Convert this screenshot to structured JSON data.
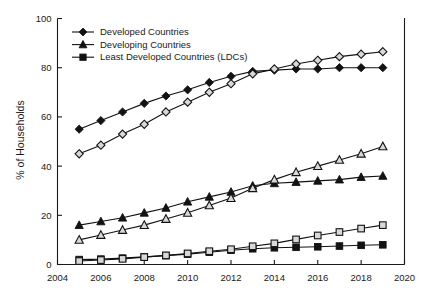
{
  "chart_data": {
    "type": "line",
    "title": "",
    "xlabel": "",
    "ylabel": "% of Households",
    "xlim": [
      2004,
      2020
    ],
    "ylim": [
      0,
      100
    ],
    "xticks": [
      2004,
      2006,
      2008,
      2010,
      2012,
      2014,
      2016,
      2018,
      2020
    ],
    "yticks": [
      0,
      20,
      40,
      60,
      80,
      100
    ],
    "grid": false,
    "legend_position": "top-left",
    "x": [
      2005,
      2006,
      2007,
      2008,
      2009,
      2010,
      2011,
      2012,
      2013,
      2014,
      2015,
      2016,
      2017,
      2018,
      2019
    ],
    "series": [
      {
        "name": "Developed Countries",
        "marker": "diamond-filled",
        "in_legend": true,
        "values": [
          55,
          58.5,
          62,
          65.5,
          68.5,
          71,
          74,
          76.5,
          78.5,
          79,
          79.5,
          79.5,
          80,
          80,
          80
        ]
      },
      {
        "name": "Developed Countries",
        "marker": "diamond-open",
        "in_legend": false,
        "values": [
          45,
          48.5,
          53,
          57,
          62,
          66,
          70,
          73.5,
          77.5,
          79.5,
          81.5,
          83,
          84.5,
          85.5,
          86.5
        ]
      },
      {
        "name": "Developing Countries",
        "marker": "triangle-filled",
        "in_legend": true,
        "values": [
          16,
          17.5,
          19,
          21,
          23,
          25.5,
          27.5,
          29.5,
          32,
          33,
          33.5,
          34,
          34.5,
          35.5,
          36
        ]
      },
      {
        "name": "Developing Countries",
        "marker": "triangle-open",
        "in_legend": false,
        "values": [
          10,
          12,
          14,
          16,
          18.5,
          21,
          24,
          27,
          31,
          34.5,
          37.5,
          40,
          42.5,
          45,
          48
        ]
      },
      {
        "name": "Least Developed Countries (LDCs)",
        "marker": "square-filled",
        "in_legend": true,
        "values": [
          2,
          2.2,
          2.6,
          3.1,
          3.6,
          4.2,
          5,
          5.8,
          6.4,
          6.8,
          7,
          7.2,
          7.5,
          7.8,
          8
        ]
      },
      {
        "name": "Least Developed Countries (LDCs)",
        "marker": "square-open",
        "in_legend": false,
        "values": [
          1.4,
          1.8,
          2.3,
          3.0,
          3.7,
          4.5,
          5.4,
          6.2,
          7.4,
          8.6,
          10.2,
          11.8,
          13.2,
          14.6,
          16
        ]
      }
    ],
    "legend": [
      {
        "label": "Developed Countries",
        "marker": "diamond-filled"
      },
      {
        "label": "Developing Countries",
        "marker": "triangle-filled"
      },
      {
        "label": "Least Developed Countries (LDCs)",
        "marker": "square-filled"
      }
    ]
  }
}
